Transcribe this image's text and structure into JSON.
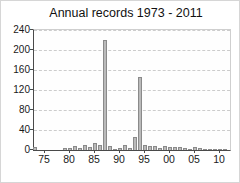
{
  "title": "Annual records 1973 - 2011",
  "chart_data": {
    "type": "bar",
    "title": "Annual records 1973 - 2011",
    "xlabel": "",
    "ylabel": "",
    "x": [
      1973,
      1974,
      1975,
      1976,
      1977,
      1978,
      1979,
      1980,
      1981,
      1982,
      1983,
      1984,
      1985,
      1986,
      1987,
      1988,
      1989,
      1990,
      1991,
      1992,
      1993,
      1994,
      1995,
      1996,
      1997,
      1998,
      1999,
      2000,
      2001,
      2002,
      2003,
      2004,
      2005,
      2006,
      2007,
      2008,
      2009,
      2010,
      2011
    ],
    "values": [
      5,
      0,
      0,
      0,
      0,
      0,
      3,
      4,
      8,
      4,
      10,
      6,
      13,
      10,
      220,
      8,
      2,
      4,
      10,
      4,
      25,
      145,
      10,
      8,
      8,
      4,
      8,
      6,
      6,
      6,
      3,
      2,
      6,
      4,
      2,
      2,
      1,
      2,
      2
    ],
    "ylim": [
      0,
      240
    ],
    "ytick_interval": 40,
    "ytick_labels": [
      "0",
      "40",
      "80",
      "120",
      "160",
      "200",
      "240"
    ],
    "xtick_labels": [
      "75",
      "80",
      "85",
      "90",
      "95",
      "00",
      "05",
      "10"
    ],
    "xtick_years": [
      1975,
      1980,
      1985,
      1990,
      1995,
      2000,
      2005,
      2010
    ],
    "grid": "horizontal-dashed",
    "legend": "none",
    "bar_color": "#bababa",
    "bar_border_color": "#8a8a8a",
    "grid_color": "#cccccc",
    "axis_color": "#4a4a4a",
    "text_color": "#111111"
  }
}
